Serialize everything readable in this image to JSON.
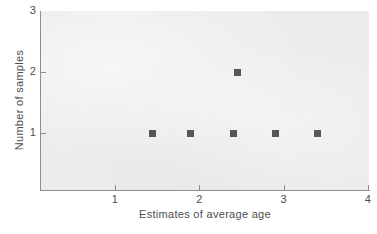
{
  "chart_data": {
    "type": "scatter",
    "title": "",
    "xlabel": "Estimates of average age",
    "ylabel": "Number of samples",
    "xlim": [
      0.5,
      4
    ],
    "ylim": [
      0,
      3
    ],
    "grid": false,
    "legend": "none",
    "x_ticks": [
      "1",
      "2",
      "3",
      "4"
    ],
    "x_tick_values": [
      1,
      2,
      3,
      4
    ],
    "y_ticks": [
      "1",
      "2",
      "3"
    ],
    "y_tick_values": [
      1,
      2,
      3
    ],
    "marker": "square",
    "marker_color": "#575757",
    "plot_background": "#ececec",
    "points": [
      {
        "x": 1.45,
        "y": 1
      },
      {
        "x": 1.9,
        "y": 1
      },
      {
        "x": 2.4,
        "y": 1
      },
      {
        "x": 2.45,
        "y": 2
      },
      {
        "x": 2.9,
        "y": 1
      },
      {
        "x": 3.4,
        "y": 1
      }
    ]
  }
}
